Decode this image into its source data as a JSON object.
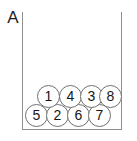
{
  "figure": {
    "panel_label": "A",
    "type": "circle-packing-diagram",
    "colors": {
      "background": "#ffffff",
      "container_stroke": "#8e8e8e",
      "circle_stroke": "#6f6f6f",
      "circle_fill": "#ffffff",
      "label_text": "#1d1d1d",
      "circle_text": "#161616"
    },
    "container": {
      "left_wall": true,
      "right_wall": true,
      "floor": true,
      "ceiling": false
    },
    "circles": [
      {
        "label": "5",
        "row": "bottom",
        "x": 2,
        "y": 92
      },
      {
        "label": "2",
        "row": "bottom",
        "x": 23,
        "y": 92
      },
      {
        "label": "6",
        "row": "bottom",
        "x": 44,
        "y": 92
      },
      {
        "label": "7",
        "row": "bottom",
        "x": 65,
        "y": 92
      },
      {
        "label": "1",
        "row": "top",
        "x": 14,
        "y": 73
      },
      {
        "label": "4",
        "row": "top",
        "x": 36,
        "y": 73
      },
      {
        "label": "3",
        "row": "top",
        "x": 57,
        "y": 73
      },
      {
        "label": "8",
        "row": "top",
        "x": 76,
        "y": 73
      }
    ]
  }
}
